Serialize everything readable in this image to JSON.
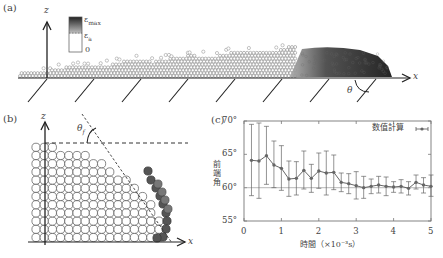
{
  "figure": {
    "panels": {
      "a": {
        "label": "(a)",
        "axis_z": "z",
        "axis_x": "x",
        "angle_label": "θ",
        "colorbar": {
          "top_label": "ε",
          "top_sub": "max",
          "mid_label": "ε",
          "mid_sub": "a",
          "bottom_label": "0"
        }
      },
      "b": {
        "label": "(b)",
        "axis_z": "z",
        "axis_x": "x",
        "angle_label": "θ",
        "angle_sub": "f"
      },
      "c": {
        "label": "(c)"
      }
    }
  },
  "chart_data": {
    "type": "line",
    "title": "",
    "xlabel": "時間（×10⁻³s）",
    "ylabel": "前端角",
    "xlim": [
      0,
      5
    ],
    "ylim": [
      55,
      70
    ],
    "x_ticks": [
      "0",
      "1",
      "2",
      "3",
      "4",
      "5"
    ],
    "y_ticks": [
      "55°",
      "60°",
      "65°",
      "70°"
    ],
    "reference_line": 60,
    "grid": false,
    "legend": {
      "position": "top-right",
      "entries": [
        "数值計算"
      ]
    },
    "series": [
      {
        "name": "数值計算",
        "x": [
          0.2,
          0.4,
          0.6,
          0.8,
          1.0,
          1.2,
          1.4,
          1.6,
          1.8,
          2.0,
          2.2,
          2.4,
          2.6,
          2.8,
          3.0,
          3.2,
          3.4,
          3.6,
          3.8,
          4.0,
          4.2,
          4.4,
          4.6,
          4.8,
          5.0
        ],
        "values": [
          64.1,
          64.0,
          64.8,
          63.4,
          62.9,
          61.3,
          61.4,
          62.6,
          61.4,
          62.5,
          62.2,
          62.3,
          60.8,
          60.6,
          60.3,
          60.0,
          60.2,
          60.4,
          60.2,
          60.1,
          60.2,
          59.9,
          60.8,
          60.4,
          60.2
        ],
        "err_low": [
          58.8,
          58.4,
          60.5,
          60.0,
          59.6,
          58.7,
          58.9,
          59.8,
          59.3,
          59.9,
          58.9,
          59.7,
          59.4,
          59.1,
          58.3,
          58.4,
          59.1,
          59.2,
          58.8,
          59.3,
          59.2,
          58.9,
          59.8,
          59.2,
          58.7
        ],
        "err_high": [
          69.5,
          69.7,
          69.2,
          67.0,
          66.3,
          64.0,
          63.9,
          65.5,
          63.5,
          65.2,
          65.5,
          64.9,
          62.2,
          62.1,
          62.4,
          61.7,
          61.3,
          61.7,
          61.6,
          60.9,
          61.2,
          60.9,
          61.9,
          61.5,
          61.9
        ]
      }
    ]
  }
}
